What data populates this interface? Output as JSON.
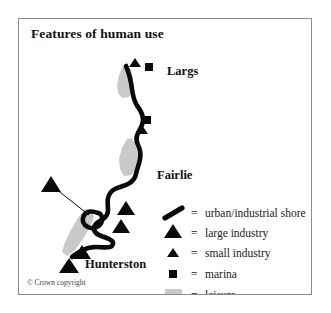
{
  "figure": {
    "title": "Features of human use",
    "copyright": "© Crown copyright",
    "frame_color": "#8a8a8a",
    "background": "#ffffff"
  },
  "map": {
    "place_labels": [
      {
        "name": "Largs",
        "text": "Largs",
        "x": 148,
        "y": 50
      },
      {
        "name": "Fairlie",
        "text": "Fairlie",
        "x": 138,
        "y": 155
      },
      {
        "name": "Hunterston",
        "text": "Hunterston",
        "x": 66,
        "y": 244
      }
    ],
    "symbol_colors": {
      "shore": "#0a0a0a",
      "industry": "#0a0a0a",
      "marina": "#0a0a0a",
      "leisure": "#c9c9c9"
    },
    "large_industry_points": [
      {
        "x": 32,
        "y": 162
      },
      {
        "x": 107,
        "y": 187
      },
      {
        "x": 102,
        "y": 205
      },
      {
        "x": 63,
        "y": 231
      },
      {
        "x": 50,
        "y": 244
      }
    ],
    "small_industry_points": [
      {
        "x": 116,
        "y": 43
      },
      {
        "x": 123,
        "y": 110
      }
    ],
    "marina_points": [
      {
        "x": 130,
        "y": 48
      },
      {
        "x": 128,
        "y": 101
      }
    ]
  },
  "legend": {
    "equals_sign": "=",
    "items": [
      {
        "symbol": "shore-swatch",
        "label": "urban/industrial shore"
      },
      {
        "symbol": "large-triangle-swatch",
        "label": "large industry"
      },
      {
        "symbol": "small-triangle-swatch",
        "label": "small industry"
      },
      {
        "symbol": "square-swatch",
        "label": "marina"
      },
      {
        "symbol": "leisure-swatch",
        "label": "leisure"
      }
    ]
  }
}
